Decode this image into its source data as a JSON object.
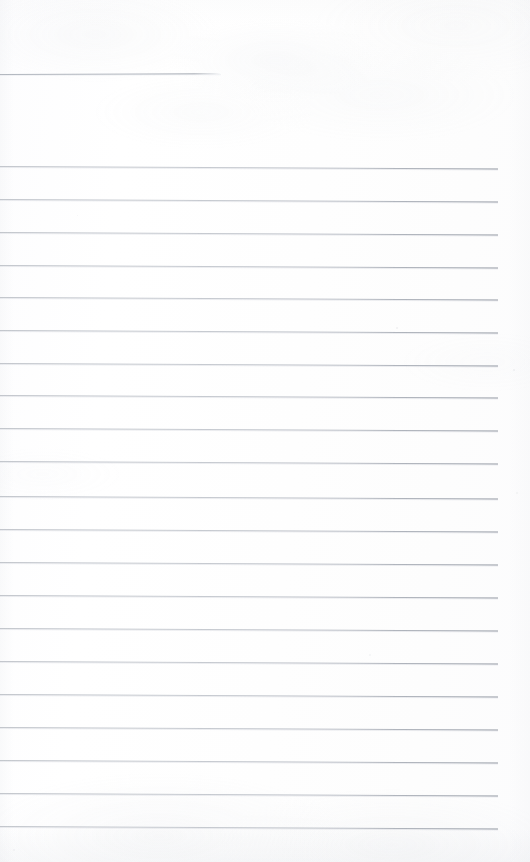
{
  "document": {
    "kind": "scanned-ruled-notebook-page",
    "title": "Blank ruled notebook page (scan)",
    "page_width": 530,
    "page_height": 862,
    "paper_color": "#fefefe",
    "rule_color": "#b0b5bd",
    "rule_color_dark": "#8e949e",
    "written_content": "",
    "handwriting_present": "no",
    "typed_text_present": "no",
    "margin_left_px": 0,
    "margin_right_px": 33,
    "rule_spacing_px": 33,
    "full_rule_count": 21,
    "partial_rule_count": 1
  },
  "rules": [
    {
      "name": "rule-top-partial",
      "y": 74,
      "x": 0,
      "width": 221,
      "partial": true,
      "skew_deg": -0.22
    },
    {
      "name": "rule-01",
      "y": 166,
      "x": 0,
      "width": 498,
      "partial": false,
      "skew_deg": 0.3
    },
    {
      "name": "rule-02",
      "y": 199,
      "x": 0,
      "width": 498,
      "partial": false,
      "skew_deg": 0.3
    },
    {
      "name": "rule-03",
      "y": 232,
      "x": 0,
      "width": 498,
      "partial": false,
      "skew_deg": 0.3
    },
    {
      "name": "rule-04",
      "y": 265,
      "x": 0,
      "width": 498,
      "partial": false,
      "skew_deg": 0.3
    },
    {
      "name": "rule-05",
      "y": 297,
      "x": 0,
      "width": 498,
      "partial": false,
      "skew_deg": 0.3
    },
    {
      "name": "rule-06",
      "y": 330,
      "x": 0,
      "width": 498,
      "partial": false,
      "skew_deg": 0.3
    },
    {
      "name": "rule-07",
      "y": 363,
      "x": 0,
      "width": 498,
      "partial": false,
      "skew_deg": 0.3
    },
    {
      "name": "rule-08",
      "y": 395,
      "x": 0,
      "width": 498,
      "partial": false,
      "skew_deg": 0.3
    },
    {
      "name": "rule-09",
      "y": 428,
      "x": 0,
      "width": 498,
      "partial": false,
      "skew_deg": 0.3
    },
    {
      "name": "rule-10",
      "y": 461,
      "x": 0,
      "width": 498,
      "partial": false,
      "skew_deg": 0.3
    },
    {
      "name": "rule-11",
      "y": 496,
      "x": 0,
      "width": 498,
      "partial": false,
      "skew_deg": 0.3
    },
    {
      "name": "rule-12",
      "y": 529,
      "x": 0,
      "width": 498,
      "partial": false,
      "skew_deg": 0.3
    },
    {
      "name": "rule-13",
      "y": 562,
      "x": 0,
      "width": 498,
      "partial": false,
      "skew_deg": 0.3
    },
    {
      "name": "rule-14",
      "y": 595,
      "x": 0,
      "width": 498,
      "partial": false,
      "skew_deg": 0.3
    },
    {
      "name": "rule-15",
      "y": 628,
      "x": 0,
      "width": 498,
      "partial": false,
      "skew_deg": 0.3
    },
    {
      "name": "rule-16",
      "y": 661,
      "x": 0,
      "width": 498,
      "partial": false,
      "skew_deg": 0.3
    },
    {
      "name": "rule-17",
      "y": 694,
      "x": 0,
      "width": 498,
      "partial": false,
      "skew_deg": 0.3
    },
    {
      "name": "rule-18",
      "y": 727,
      "x": 0,
      "width": 498,
      "partial": false,
      "skew_deg": 0.3
    },
    {
      "name": "rule-19",
      "y": 760,
      "x": 0,
      "width": 498,
      "partial": false,
      "skew_deg": 0.3
    },
    {
      "name": "rule-20",
      "y": 793,
      "x": 0,
      "width": 498,
      "partial": false,
      "skew_deg": 0.3
    },
    {
      "name": "rule-21",
      "y": 826,
      "x": 0,
      "width": 498,
      "partial": false,
      "skew_deg": 0.3
    }
  ],
  "specks": [
    {
      "name": "speck-upper-right",
      "x": 396,
      "y": 327,
      "size": 2.0,
      "opacity": 0.4
    },
    {
      "name": "speck-right-margin-a",
      "x": 513,
      "y": 369,
      "size": 1.6,
      "opacity": 0.3
    },
    {
      "name": "speck-right-margin-b",
      "x": 516,
      "y": 492,
      "size": 1.6,
      "opacity": 0.28
    },
    {
      "name": "speck-mid-left",
      "x": 77,
      "y": 215,
      "size": 1.4,
      "opacity": 0.26
    },
    {
      "name": "speck-mid-right",
      "x": 369,
      "y": 654,
      "size": 1.5,
      "opacity": 0.24
    },
    {
      "name": "speck-lower-left",
      "x": 13,
      "y": 849,
      "size": 2.2,
      "opacity": 0.32
    }
  ]
}
